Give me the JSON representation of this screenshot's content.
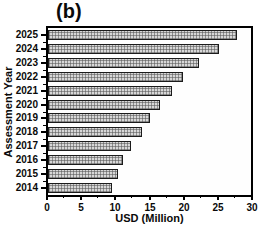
{
  "panel_label": "(b)",
  "chart_data": {
    "type": "bar",
    "orientation": "horizontal",
    "title": "(b)",
    "xlabel": "USD (Million)",
    "ylabel": "Assessment Year",
    "categories": [
      "2025",
      "2024",
      "2023",
      "2022",
      "2021",
      "2020",
      "2019",
      "2018",
      "2017",
      "2016",
      "2015",
      "2014"
    ],
    "values": [
      27.9,
      25.2,
      22.3,
      20.0,
      18.3,
      16.6,
      15.0,
      13.9,
      12.2,
      11.1,
      10.4,
      9.5
    ],
    "xlim": [
      0,
      30
    ],
    "x_major_ticks": [
      0,
      5,
      10,
      15,
      20,
      25,
      30
    ],
    "x_major_tick_labels": [
      "0",
      "5",
      "10",
      "15",
      "20",
      "25",
      "30"
    ],
    "x_minor_ticks": [
      2.5,
      7.5,
      12.5,
      17.5,
      22.5,
      27.5
    ],
    "grid": "off",
    "legend": "none",
    "bar_fill_color": "#d7d7d7",
    "bar_pattern": "fine-grid-crosshatch",
    "bar_pattern_color": "#555555",
    "bar_border_color": "#1b1b1b",
    "frame_color": "#000000",
    "background_color": "#ffffff",
    "text_color": "#0a0a0a"
  }
}
